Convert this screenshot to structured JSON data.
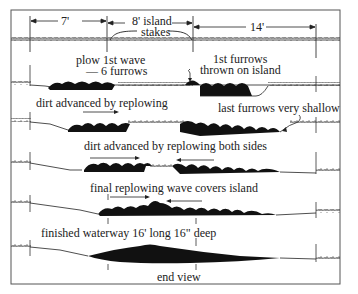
{
  "diagram": {
    "title": "",
    "dimensions": {
      "left": "7'",
      "center": "8' island",
      "right": "14'"
    },
    "stakes_label": "stakes",
    "stages": [
      {
        "id": "stage-1",
        "label_line1": "plow 1st wave",
        "label_line2": "— 6 furrows",
        "callout": "1st furrows",
        "callout_line2": "thrown on island"
      },
      {
        "id": "stage-2",
        "label": "dirt advanced by replowing",
        "callout": "last furrows very shallow"
      },
      {
        "id": "stage-3",
        "label": "dirt advanced by replowing both sides"
      },
      {
        "id": "stage-4",
        "label": "final replowing wave covers island"
      },
      {
        "id": "stage-5",
        "label": "finished waterway 16' long 16\" deep"
      }
    ],
    "caption": "end view",
    "colors": {
      "ink": "#111111",
      "frame": "#555555",
      "background": "#ffffff"
    }
  }
}
